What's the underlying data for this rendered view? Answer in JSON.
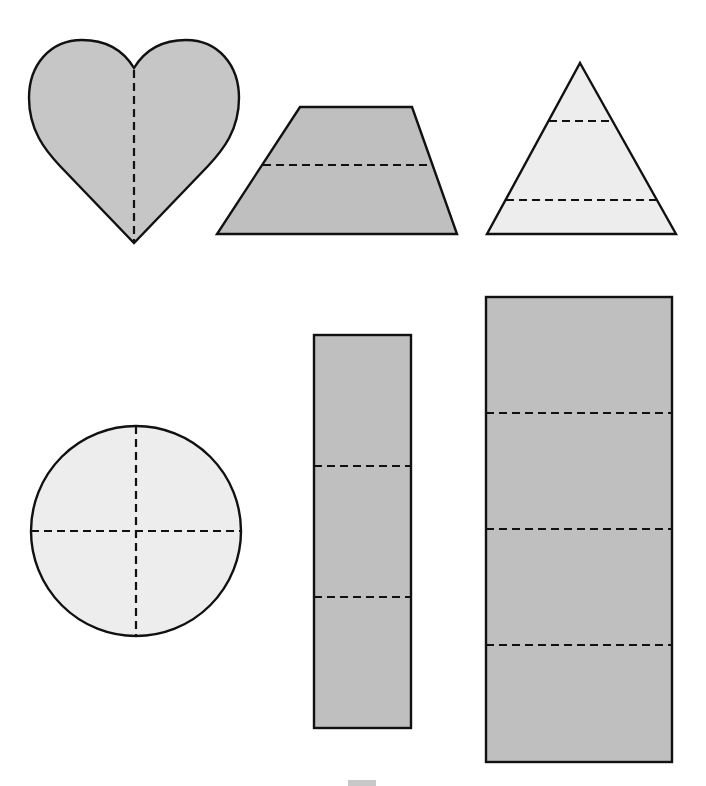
{
  "figure": {
    "colors": {
      "dark_fill": "#bfbfbf",
      "heart_fill": "#c6c6c6",
      "light_fill": "#ededed",
      "outline": "#111111",
      "background": "#ffffff"
    },
    "shapes": [
      {
        "name": "heart",
        "fill": "heart_fill",
        "parts": 2,
        "divider": "vertical"
      },
      {
        "name": "trapezoid",
        "fill": "dark_fill",
        "parts": 2,
        "divider": "horizontal"
      },
      {
        "name": "triangle",
        "fill": "light_fill",
        "parts": 3,
        "divider": "horizontal"
      },
      {
        "name": "circle",
        "fill": "light_fill",
        "parts": 4,
        "divider": "cross"
      },
      {
        "name": "narrow-rectangle",
        "fill": "dark_fill",
        "parts": 3,
        "divider": "horizontal"
      },
      {
        "name": "wide-rectangle",
        "fill": "dark_fill",
        "parts": 4,
        "divider": "horizontal"
      }
    ]
  }
}
